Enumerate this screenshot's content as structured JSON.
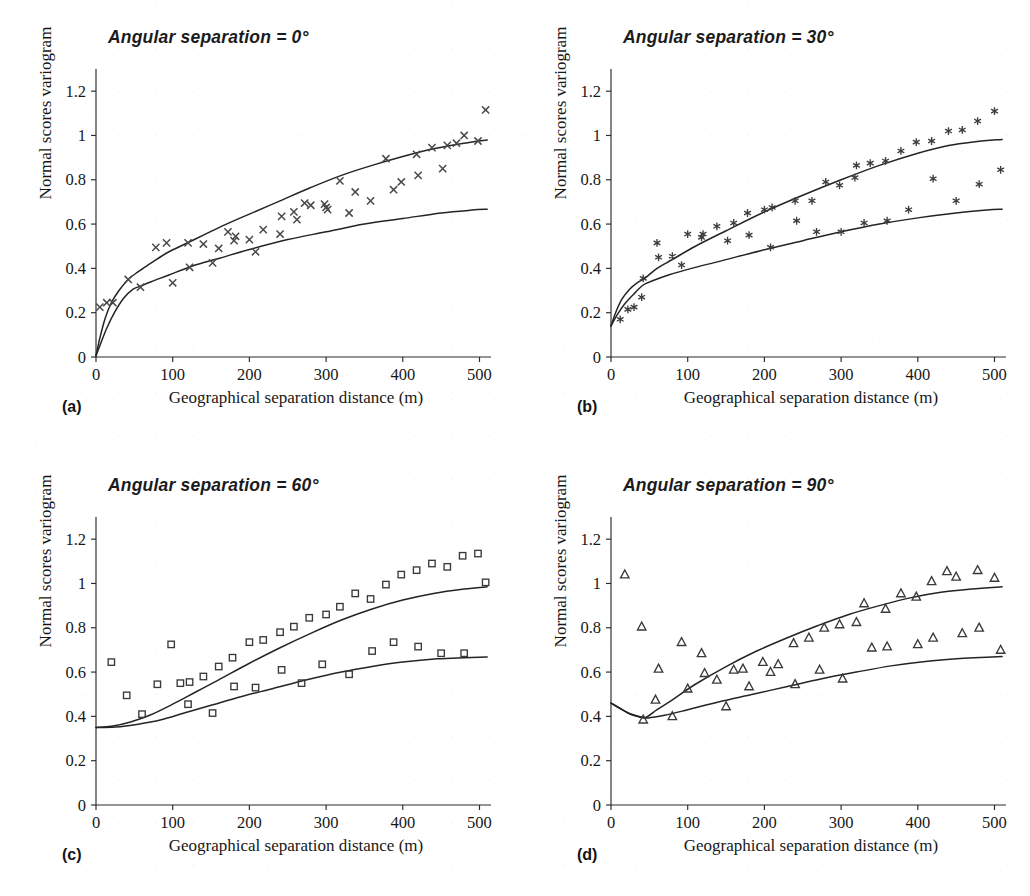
{
  "figure": {
    "axis_color": "#2a2a2a",
    "curve_color": "#242424",
    "marker_color": "#3a3a3a",
    "background": "#ffffff",
    "shared": {
      "xlabel": "Geographical separation distance (m)",
      "ylabel": "Normal scores variogram",
      "xticks": [
        "0",
        "100",
        "200",
        "300",
        "400",
        "500"
      ],
      "yticks": [
        "0",
        "0.2",
        "0.4",
        "0.6",
        "0.8",
        "1",
        "1.2"
      ]
    }
  },
  "chart_data": [
    {
      "type": "scatter",
      "panel": "(a)",
      "title": "Angular separation = 0°",
      "xlabel": "Geographical separation distance (m)",
      "ylabel": "Normal scores variogram",
      "xlim": [
        0,
        515
      ],
      "ylim": [
        0,
        1.3
      ],
      "xticks": [
        0,
        100,
        200,
        300,
        400,
        500
      ],
      "yticks": [
        0,
        0.2,
        0.4,
        0.6,
        0.8,
        1.0,
        1.2
      ],
      "grid": false,
      "legend": "none",
      "marker": "x",
      "points": {
        "x": [
          5,
          14,
          22,
          42,
          58,
          78,
          92,
          100,
          120,
          122,
          140,
          152,
          160,
          172,
          180,
          182,
          200,
          208,
          218,
          240,
          242,
          258,
          262,
          272,
          280,
          298,
          300,
          302,
          318,
          330,
          338,
          358,
          378,
          388,
          398,
          418,
          420,
          438,
          452,
          458,
          470,
          480,
          498,
          508
        ],
        "y": [
          0.225,
          0.245,
          0.245,
          0.35,
          0.315,
          0.495,
          0.515,
          0.335,
          0.515,
          0.405,
          0.51,
          0.425,
          0.49,
          0.565,
          0.525,
          0.545,
          0.53,
          0.475,
          0.575,
          0.555,
          0.635,
          0.655,
          0.62,
          0.695,
          0.685,
          0.69,
          0.675,
          0.665,
          0.795,
          0.65,
          0.745,
          0.705,
          0.895,
          0.755,
          0.79,
          0.915,
          0.82,
          0.945,
          0.85,
          0.955,
          0.965,
          1.0,
          0.975,
          1.115
        ]
      },
      "model_curves": [
        {
          "name": "upper-model",
          "x": [
            0,
            5,
            12,
            20,
            30,
            42,
            55,
            70,
            90,
            110,
            140,
            170,
            200,
            240,
            280,
            320,
            360,
            400,
            440,
            480,
            510
          ],
          "y": [
            0.005,
            0.085,
            0.175,
            0.245,
            0.3,
            0.35,
            0.385,
            0.42,
            0.465,
            0.5,
            0.55,
            0.6,
            0.645,
            0.705,
            0.765,
            0.82,
            0.865,
            0.905,
            0.94,
            0.965,
            0.98
          ]
        },
        {
          "name": "lower-model",
          "x": [
            0,
            6,
            14,
            24,
            36,
            48,
            58,
            72,
            95,
            125,
            160,
            200,
            250,
            300,
            350,
            400,
            450,
            490,
            510
          ],
          "y": [
            0.005,
            0.06,
            0.13,
            0.2,
            0.265,
            0.305,
            0.32,
            0.34,
            0.37,
            0.41,
            0.445,
            0.485,
            0.53,
            0.565,
            0.6,
            0.625,
            0.65,
            0.663,
            0.667
          ]
        }
      ]
    },
    {
      "type": "scatter",
      "panel": "(b)",
      "title": "Angular separation = 30°",
      "xlabel": "Geographical separation distance (m)",
      "ylabel": "Normal scores variogram",
      "xlim": [
        0,
        515
      ],
      "ylim": [
        0,
        1.3
      ],
      "xticks": [
        0,
        100,
        200,
        300,
        400,
        500
      ],
      "yticks": [
        0,
        0.2,
        0.4,
        0.6,
        0.8,
        1.0,
        1.2
      ],
      "grid": false,
      "legend": "none",
      "marker": "star",
      "points": {
        "x": [
          12,
          22,
          30,
          40,
          42,
          60,
          62,
          80,
          92,
          100,
          118,
          120,
          138,
          152,
          160,
          178,
          180,
          200,
          208,
          210,
          240,
          242,
          262,
          268,
          280,
          298,
          300,
          318,
          320,
          330,
          338,
          358,
          360,
          378,
          388,
          398,
          418,
          420,
          440,
          450,
          458,
          478,
          480,
          500,
          508
        ],
        "y": [
          0.17,
          0.215,
          0.225,
          0.27,
          0.355,
          0.515,
          0.45,
          0.455,
          0.415,
          0.555,
          0.54,
          0.555,
          0.59,
          0.525,
          0.605,
          0.65,
          0.55,
          0.665,
          0.495,
          0.675,
          0.705,
          0.615,
          0.705,
          0.565,
          0.79,
          0.775,
          0.565,
          0.81,
          0.865,
          0.605,
          0.875,
          0.885,
          0.615,
          0.93,
          0.665,
          0.97,
          0.975,
          0.805,
          1.02,
          0.705,
          1.025,
          1.065,
          0.78,
          1.11,
          0.845
        ]
      },
      "model_curves": [
        {
          "name": "upper-model",
          "x": [
            0,
            6,
            14,
            24,
            34,
            44,
            60,
            80,
            110,
            150,
            200,
            250,
            300,
            350,
            400,
            440,
            475,
            510
          ],
          "y": [
            0.14,
            0.2,
            0.26,
            0.305,
            0.335,
            0.355,
            0.4,
            0.44,
            0.5,
            0.57,
            0.655,
            0.73,
            0.8,
            0.865,
            0.92,
            0.955,
            0.972,
            0.982
          ]
        },
        {
          "name": "lower-model",
          "x": [
            0,
            8,
            18,
            30,
            42,
            55,
            75,
            105,
            145,
            195,
            250,
            300,
            350,
            400,
            450,
            490,
            510
          ],
          "y": [
            0.14,
            0.19,
            0.24,
            0.285,
            0.325,
            0.345,
            0.37,
            0.4,
            0.435,
            0.48,
            0.525,
            0.565,
            0.6,
            0.628,
            0.65,
            0.663,
            0.667
          ]
        }
      ]
    },
    {
      "type": "scatter",
      "panel": "(c)",
      "title": "Angular separation = 60°",
      "xlabel": "Geographical separation distance (m)",
      "ylabel": "Normal scores variogram",
      "xlim": [
        0,
        515
      ],
      "ylim": [
        0,
        1.3
      ],
      "xticks": [
        0,
        100,
        200,
        300,
        400,
        500
      ],
      "yticks": [
        0,
        0.2,
        0.4,
        0.6,
        0.8,
        1.0,
        1.2
      ],
      "grid": false,
      "legend": "none",
      "marker": "square",
      "points": {
        "x": [
          20,
          40,
          60,
          80,
          98,
          110,
          120,
          122,
          140,
          152,
          160,
          178,
          180,
          200,
          208,
          218,
          240,
          242,
          258,
          268,
          278,
          295,
          300,
          318,
          330,
          338,
          358,
          360,
          378,
          388,
          398,
          418,
          420,
          438,
          450,
          458,
          478,
          480,
          498,
          508
        ],
        "y": [
          0.645,
          0.495,
          0.41,
          0.545,
          0.725,
          0.55,
          0.455,
          0.555,
          0.58,
          0.415,
          0.625,
          0.665,
          0.535,
          0.735,
          0.53,
          0.745,
          0.78,
          0.61,
          0.805,
          0.55,
          0.845,
          0.635,
          0.86,
          0.895,
          0.59,
          0.955,
          0.93,
          0.695,
          0.995,
          0.735,
          1.04,
          1.06,
          0.715,
          1.09,
          0.685,
          1.075,
          1.125,
          0.685,
          1.135,
          1.005
        ]
      },
      "model_curves": [
        {
          "name": "upper-model",
          "x": [
            0,
            20,
            45,
            70,
            100,
            130,
            160,
            200,
            240,
            280,
            320,
            360,
            400,
            440,
            480,
            510
          ],
          "y": [
            0.35,
            0.355,
            0.375,
            0.405,
            0.455,
            0.51,
            0.565,
            0.64,
            0.71,
            0.775,
            0.835,
            0.885,
            0.925,
            0.955,
            0.975,
            0.985
          ]
        },
        {
          "name": "lower-model",
          "x": [
            0,
            25,
            55,
            85,
            115,
            150,
            190,
            230,
            275,
            320,
            360,
            400,
            445,
            480,
            510
          ],
          "y": [
            0.35,
            0.352,
            0.365,
            0.385,
            0.415,
            0.45,
            0.49,
            0.525,
            0.565,
            0.6,
            0.625,
            0.645,
            0.66,
            0.665,
            0.668
          ]
        }
      ]
    },
    {
      "type": "scatter",
      "panel": "(d)",
      "title": "Angular separation = 90°",
      "xlabel": "Geographical separation distance (m)",
      "ylabel": "Normal scores variogram",
      "xlim": [
        0,
        515
      ],
      "ylim": [
        0,
        1.3
      ],
      "xticks": [
        0,
        100,
        200,
        300,
        400,
        500
      ],
      "yticks": [
        0,
        0.2,
        0.4,
        0.6,
        0.8,
        1.0,
        1.2
      ],
      "grid": false,
      "legend": "none",
      "marker": "triangle",
      "points": {
        "x": [
          18,
          40,
          42,
          58,
          62,
          80,
          92,
          100,
          118,
          122,
          138,
          150,
          160,
          172,
          180,
          198,
          208,
          218,
          238,
          240,
          258,
          272,
          278,
          298,
          302,
          320,
          330,
          340,
          358,
          360,
          378,
          398,
          400,
          418,
          420,
          438,
          450,
          458,
          478,
          480,
          500,
          508
        ],
        "y": [
          1.04,
          0.805,
          0.385,
          0.475,
          0.615,
          0.4,
          0.735,
          0.525,
          0.685,
          0.595,
          0.565,
          0.445,
          0.61,
          0.615,
          0.535,
          0.645,
          0.6,
          0.635,
          0.73,
          0.545,
          0.755,
          0.61,
          0.8,
          0.815,
          0.57,
          0.825,
          0.91,
          0.71,
          0.885,
          0.715,
          0.955,
          0.94,
          0.725,
          1.01,
          0.755,
          1.055,
          1.03,
          0.775,
          1.06,
          0.8,
          1.025,
          0.7
        ]
      },
      "model_curves": [
        {
          "name": "upper-model",
          "x": [
            0,
            10,
            22,
            34,
            45,
            60,
            80,
            110,
            150,
            190,
            230,
            270,
            310,
            350,
            390,
            430,
            470,
            510
          ],
          "y": [
            0.46,
            0.44,
            0.415,
            0.4,
            0.395,
            0.43,
            0.475,
            0.545,
            0.625,
            0.695,
            0.755,
            0.81,
            0.86,
            0.9,
            0.935,
            0.96,
            0.975,
            0.985
          ]
        },
        {
          "name": "lower-model",
          "x": [
            0,
            12,
            25,
            38,
            48,
            70,
            100,
            140,
            185,
            230,
            275,
            320,
            365,
            410,
            455,
            490,
            510
          ],
          "y": [
            0.46,
            0.435,
            0.412,
            0.398,
            0.393,
            0.405,
            0.43,
            0.465,
            0.5,
            0.535,
            0.57,
            0.6,
            0.628,
            0.648,
            0.661,
            0.667,
            0.67
          ]
        }
      ]
    }
  ]
}
